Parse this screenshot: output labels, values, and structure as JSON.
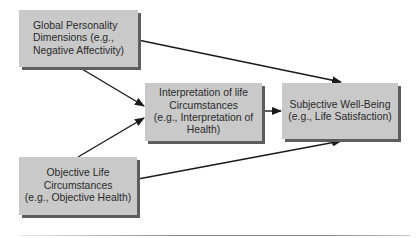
{
  "diagram": {
    "nodes": [
      {
        "id": "global-personality",
        "lines": [
          "Global Personality",
          "Dimensions (e.g.,",
          "Negative Affectivity)"
        ]
      },
      {
        "id": "interpretation",
        "lines": [
          "Interpretation of life",
          "Circumstances",
          "(e.g., Interpretation of",
          "Health)"
        ]
      },
      {
        "id": "subjective-wellbeing",
        "lines": [
          "Subjective Well-Being",
          "(e.g., Life Satisfaction)"
        ]
      },
      {
        "id": "objective-life",
        "lines": [
          "Objective Life",
          "Circumstances",
          "(e.g., Objective Health)"
        ]
      }
    ],
    "edges": [
      {
        "from": "global-personality",
        "to": "subjective-wellbeing"
      },
      {
        "from": "global-personality",
        "to": "interpretation"
      },
      {
        "from": "objective-life",
        "to": "interpretation"
      },
      {
        "from": "interpretation",
        "to": "subjective-wellbeing"
      },
      {
        "from": "objective-life",
        "to": "subjective-wellbeing"
      }
    ],
    "colors": {
      "box_fill": "#c9c9c9",
      "box_shadow": "#5e5e5e",
      "line": "#1a1a1a",
      "text": "#2a2a2a"
    }
  }
}
